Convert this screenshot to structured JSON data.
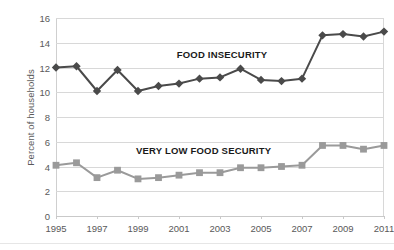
{
  "chart_data": {
    "type": "line",
    "title": "",
    "xlabel": "",
    "ylabel": "Percent of households",
    "xlim": [
      1995,
      2011
    ],
    "ylim": [
      0,
      16
    ],
    "y_ticks": [
      0,
      2,
      4,
      6,
      8,
      10,
      12,
      14,
      16
    ],
    "x_ticks": [
      1995,
      1997,
      1999,
      2001,
      2003,
      2005,
      2007,
      2009,
      2011
    ],
    "x": [
      1995,
      1996,
      1997,
      1998,
      1999,
      2000,
      2001,
      2002,
      2003,
      2004,
      2005,
      2006,
      2007,
      2008,
      2009,
      2010,
      2011
    ],
    "grid": true,
    "legend_position": "inline-annotation",
    "series": [
      {
        "name": "FOOD INSECURITY",
        "marker": "diamond",
        "color": "#4a4a4a",
        "values": [
          12.0,
          12.1,
          10.1,
          11.8,
          10.1,
          10.5,
          10.7,
          11.1,
          11.2,
          11.9,
          11.0,
          10.9,
          11.1,
          14.6,
          14.7,
          14.5,
          14.9
        ]
      },
      {
        "name": "VERY LOW FOOD SECURITY",
        "marker": "square",
        "color": "#9a9a9a",
        "values": [
          4.1,
          4.3,
          3.1,
          3.7,
          3.0,
          3.1,
          3.3,
          3.5,
          3.5,
          3.9,
          3.9,
          4.0,
          4.1,
          5.7,
          5.7,
          5.4,
          5.7
        ]
      }
    ],
    "annotations": [
      {
        "text": "FOOD INSECURITY",
        "x": 2003.1,
        "y": 13.0
      },
      {
        "text": "VERY LOW FOOD SECURITY",
        "x": 2002.2,
        "y": 5.25
      }
    ]
  },
  "colors": {
    "series_1": "#4a4a4a",
    "series_2": "#9a9a9a",
    "grid": "#d8d8d8",
    "axis": "#c9c9c9",
    "tick_text": "#595959",
    "annotation_text": "#1a1a1a",
    "background": "#ffffff"
  }
}
